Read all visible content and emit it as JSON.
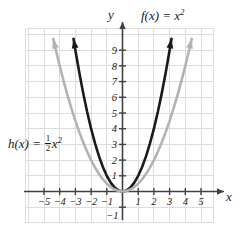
{
  "chart_data": {
    "type": "line",
    "title": "",
    "xlabel": "x",
    "ylabel": "y",
    "xlim": [
      -6.2,
      6.2
    ],
    "ylim": [
      -1.6,
      10.2
    ],
    "grid": true,
    "legend": "inline-annotations",
    "x_ticks": [
      -5,
      -4,
      -3,
      -2,
      -1,
      1,
      2,
      3,
      4,
      5
    ],
    "x_tick_labels": [
      "−5",
      "−4",
      "−3",
      "−2",
      "−1",
      "1",
      "2",
      "3",
      "4",
      "5"
    ],
    "y_ticks": [
      -1,
      1,
      2,
      3,
      4,
      5,
      6,
      7,
      8,
      9
    ],
    "y_tick_labels": [
      "−1",
      "1",
      "2",
      "3",
      "4",
      "5",
      "6",
      "7",
      "8",
      "9"
    ],
    "series": [
      {
        "name": "f",
        "label": "f(x) = x²",
        "equation": "y = x^2",
        "color": "#1a1a1a",
        "linewidth": 2.6,
        "arrows": "both-ends",
        "x": [
          -3.12,
          -3.0,
          -2.75,
          -2.5,
          -2.25,
          -2.0,
          -1.75,
          -1.5,
          -1.25,
          -1.0,
          -0.75,
          -0.5,
          -0.25,
          0,
          0.25,
          0.5,
          0.75,
          1.0,
          1.25,
          1.5,
          1.75,
          2.0,
          2.25,
          2.5,
          2.75,
          3.0,
          3.12
        ],
        "y": [
          9.73,
          9.0,
          7.5625,
          6.25,
          5.0625,
          4.0,
          3.0625,
          2.25,
          1.5625,
          1.0,
          0.5625,
          0.25,
          0.0625,
          0,
          0.0625,
          0.25,
          0.5625,
          1.0,
          1.5625,
          2.25,
          3.0625,
          4.0,
          5.0625,
          6.25,
          7.5625,
          9.0,
          9.73
        ]
      },
      {
        "name": "h",
        "label": "h(x) = ½x²",
        "equation": "y = (1/2)x^2",
        "color": "#b3b3b3",
        "linewidth": 2.6,
        "arrows": "both-ends",
        "x": [
          -4.41,
          -4.25,
          -4.0,
          -3.75,
          -3.5,
          -3.25,
          -3.0,
          -2.75,
          -2.5,
          -2.25,
          -2.0,
          -1.75,
          -1.5,
          -1.25,
          -1.0,
          -0.75,
          -0.5,
          -0.25,
          0,
          0.25,
          0.5,
          0.75,
          1.0,
          1.25,
          1.5,
          1.75,
          2.0,
          2.25,
          2.5,
          2.75,
          3.0,
          3.25,
          3.5,
          3.75,
          4.0,
          4.25,
          4.41
        ],
        "y": [
          9.72,
          9.03,
          8.0,
          7.03,
          6.125,
          5.28,
          4.5,
          3.78,
          3.125,
          2.53,
          2.0,
          1.53,
          1.125,
          0.78,
          0.5,
          0.28,
          0.125,
          0.03,
          0,
          0.03,
          0.125,
          0.28,
          0.5,
          0.78,
          1.125,
          1.53,
          2.0,
          2.53,
          3.125,
          3.78,
          4.5,
          5.28,
          6.125,
          7.03,
          8.0,
          9.03,
          9.72
        ]
      }
    ],
    "annotations": [
      {
        "id": "label-f",
        "text_parts": {
          "prefix": "f(x) = x",
          "exponent": "2"
        }
      },
      {
        "id": "label-h",
        "text_parts": {
          "prefix": "h(x) = ",
          "numerator": "1",
          "denominator": "2",
          "var": "x",
          "exponent": "2"
        }
      }
    ],
    "colors": {
      "axis": "#404040",
      "grid": "#dcdcdc",
      "background": "#ffffff",
      "f_curve": "#1a1a1a",
      "h_curve": "#b3b3b3",
      "text": "#1a1a1a"
    }
  },
  "axis_names": {
    "x": "x",
    "y": "y"
  }
}
